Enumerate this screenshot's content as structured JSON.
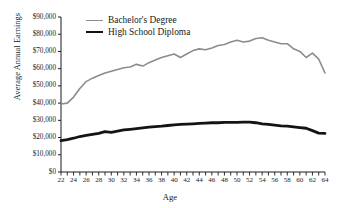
{
  "chart_data": {
    "type": "line",
    "title": "",
    "xlabel": "Age",
    "ylabel": "Average Annual Earnings",
    "xlim": [
      22,
      64
    ],
    "ylim": [
      0,
      90000
    ],
    "grid": false,
    "legend_position": "top-left",
    "x": [
      22,
      23,
      24,
      25,
      26,
      27,
      28,
      29,
      30,
      31,
      32,
      33,
      34,
      35,
      36,
      37,
      38,
      39,
      40,
      41,
      42,
      43,
      44,
      45,
      46,
      47,
      48,
      49,
      50,
      51,
      52,
      53,
      54,
      55,
      56,
      57,
      58,
      59,
      60,
      61,
      62,
      63,
      64
    ],
    "xticklabels": [
      "22",
      "24",
      "26",
      "28",
      "30",
      "32",
      "34",
      "36",
      "38",
      "40",
      "42",
      "44",
      "46",
      "48",
      "50",
      "52",
      "54",
      "56",
      "58",
      "60",
      "62",
      "64"
    ],
    "yticklabels": [
      "$0",
      "$10,000",
      "$20,000",
      "$30,000",
      "$40,000",
      "$50,000",
      "$60,000",
      "$70,000",
      "$80,000",
      "$90,000"
    ],
    "ytickvalues": [
      0,
      10000,
      20000,
      30000,
      40000,
      50000,
      60000,
      70000,
      80000,
      90000
    ],
    "series": [
      {
        "name": "Bachelor's Degree",
        "color": "#8c8c8c",
        "linewidth": 1.6,
        "values": [
          39500,
          40000,
          43500,
          48500,
          52500,
          54500,
          56000,
          57500,
          58500,
          59500,
          60500,
          61000,
          62500,
          61500,
          63500,
          65000,
          66500,
          67500,
          68500,
          66500,
          68500,
          70500,
          71500,
          71000,
          72000,
          73500,
          74000,
          75500,
          76500,
          75500,
          76000,
          77500,
          78000,
          76500,
          75500,
          74500,
          74500,
          71500,
          70000,
          66500,
          69000,
          65500,
          57500
        ]
      },
      {
        "name": "High School Diploma",
        "color": "#141414",
        "linewidth": 2.8,
        "values": [
          18200,
          18800,
          19600,
          20600,
          21200,
          21800,
          22400,
          23400,
          23000,
          23800,
          24400,
          24800,
          25200,
          25600,
          26000,
          26400,
          26600,
          27000,
          27400,
          27600,
          27800,
          28000,
          28200,
          28400,
          28600,
          28600,
          28800,
          28800,
          28800,
          29000,
          29000,
          28600,
          28000,
          27600,
          27200,
          26800,
          26600,
          26200,
          25800,
          25400,
          24000,
          22600,
          22400
        ]
      }
    ]
  },
  "legend": {
    "bachelor_label": "Bachelor's Degree",
    "highschool_label": "High School Diploma"
  }
}
